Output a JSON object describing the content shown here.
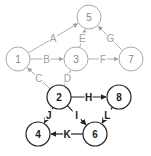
{
  "diagram": {
    "nodes": [
      {
        "id": "1",
        "label": "1",
        "x": 18,
        "y": 59,
        "style": "light"
      },
      {
        "id": "3",
        "label": "3",
        "x": 76,
        "y": 59,
        "style": "light"
      },
      {
        "id": "5",
        "label": "5",
        "x": 89,
        "y": 17,
        "style": "light"
      },
      {
        "id": "7",
        "label": "7",
        "x": 131,
        "y": 59,
        "style": "light"
      },
      {
        "id": "2",
        "label": "2",
        "x": 59,
        "y": 97,
        "style": "dark"
      },
      {
        "id": "8",
        "label": "8",
        "x": 119,
        "y": 97,
        "style": "dark"
      },
      {
        "id": "4",
        "label": "4",
        "x": 38,
        "y": 134,
        "style": "dark"
      },
      {
        "id": "6",
        "label": "6",
        "x": 95,
        "y": 134,
        "style": "dark"
      }
    ],
    "edges": [
      {
        "label": "A",
        "from": "1",
        "to": "5",
        "style": "light"
      },
      {
        "label": "B",
        "from": "1",
        "to": "3",
        "style": "light"
      },
      {
        "label": "C",
        "from": "2",
        "to": "1",
        "style": "light"
      },
      {
        "label": "D",
        "from": "2",
        "to": "3",
        "style": "light"
      },
      {
        "label": "E",
        "from": "3",
        "to": "5",
        "style": "light"
      },
      {
        "label": "F",
        "from": "3",
        "to": "7",
        "style": "light"
      },
      {
        "label": "G",
        "from": "7",
        "to": "5",
        "style": "light"
      },
      {
        "label": "H",
        "from": "2",
        "to": "8",
        "style": "dark"
      },
      {
        "label": "I",
        "from": "2",
        "to": "6",
        "style": "dark"
      },
      {
        "label": "J",
        "from": "2",
        "to": "4",
        "style": "dark"
      },
      {
        "label": "K",
        "from": "6",
        "to": "4",
        "style": "dark"
      },
      {
        "label": "L",
        "from": "8",
        "to": "6",
        "style": "dark"
      }
    ],
    "colors": {
      "light": "#a8a8a8",
      "dark": "#222222",
      "background": "#ffffff"
    }
  }
}
